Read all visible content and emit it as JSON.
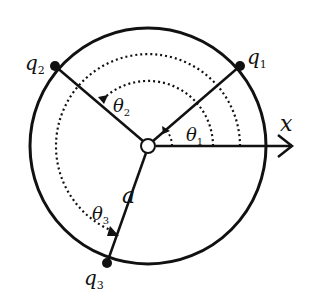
{
  "diagram": {
    "colors": {
      "stroke": "#111111",
      "background": "#ffffff"
    },
    "center": {
      "x": 148,
      "y": 146
    },
    "radius_px": 118,
    "axis": {
      "label": "x"
    },
    "radius_label": "a",
    "charges": [
      {
        "id": "q1",
        "label": "q",
        "subscript": "1",
        "angle_deg": 40
      },
      {
        "id": "q2",
        "label": "q",
        "subscript": "2",
        "angle_deg": 140
      },
      {
        "id": "q3",
        "label": "q",
        "subscript": "3",
        "angle_deg": 248
      }
    ],
    "angles": [
      {
        "id": "theta1",
        "label": "θ",
        "subscript": "1"
      },
      {
        "id": "theta2",
        "label": "θ",
        "subscript": "2"
      },
      {
        "id": "theta3",
        "label": "θ",
        "subscript": "3"
      }
    ]
  }
}
